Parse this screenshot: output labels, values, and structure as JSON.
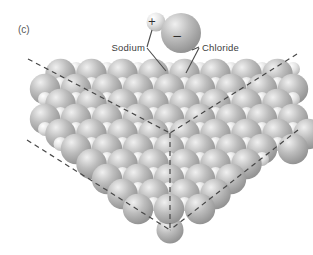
{
  "figure": {
    "panel_label": "(c)",
    "labels": {
      "sodium": "Sodium",
      "chloride": "Chloride"
    },
    "ion_pair": {
      "cation_charge": "+",
      "anion_charge": "−"
    }
  },
  "colors": {
    "background": "#ffffff",
    "sphere_large": {
      "highlight": "#f0f0f0",
      "mid": "#bdbdbd",
      "shade": "#999999",
      "edge": "#8c8c8c"
    },
    "sphere_small": {
      "highlight": "#ffffff",
      "mid": "#e2e2e2",
      "edge": "#b0b0b0"
    },
    "guide_line": "#474747",
    "pointer_line": "#4a4a4a",
    "label_text": "#3d3d3d",
    "panel_text": "#575757"
  },
  "crystal": {
    "large_ion": "chloride",
    "small_ion": "sodium",
    "large_radius": 15.2,
    "small_radius": 7,
    "cell_step": 15.5,
    "row_step": 15,
    "first_row_y": 74,
    "last_row_y": 209,
    "row_origin_x": 45,
    "small_y_lift": 5,
    "max_cells_per_row": 20,
    "bounds": {
      "left_top": [
        55,
        64
      ],
      "left_corner": [
        40,
        135
      ],
      "right_top": [
        293,
        62
      ],
      "right_corner": [
        301,
        138
      ],
      "apex": [
        170,
        230
      ]
    },
    "apex_sphere": {
      "x": 170,
      "y": 230,
      "r": 13.5
    },
    "ion_pair": {
      "small": {
        "x": 156,
        "y": 22,
        "r": 9.5
      },
      "large": {
        "x": 181,
        "y": 33,
        "r": 20
      }
    },
    "guide_lines": [
      [
        [
          28,
          59
        ],
        [
          170,
          133
        ]
      ],
      [
        [
          297,
          54
        ],
        [
          170,
          133
        ]
      ],
      [
        [
          170,
          133
        ],
        [
          170,
          230
        ]
      ],
      [
        [
          27,
          140
        ],
        [
          170,
          230
        ]
      ],
      [
        [
          298,
          130
        ],
        [
          170,
          230
        ]
      ]
    ],
    "pointer_lines": {
      "sodium_to_ion": [
        [
          147,
          47
        ],
        [
          152,
          30
        ]
      ],
      "sodium_to_crystal": [
        [
          147,
          48
        ],
        [
          166,
          71
        ]
      ],
      "chloride_to_ion": [
        [
          199,
          47
        ],
        [
          192,
          50
        ]
      ],
      "chloride_to_crystal": [
        [
          199,
          48
        ],
        [
          186,
          73
        ]
      ]
    }
  }
}
